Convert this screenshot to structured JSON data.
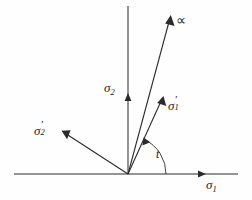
{
  "figure": {
    "type": "vector-diagram",
    "background_color": "#fefefe",
    "ink_color": "#2b2b2b"
  },
  "axes": {
    "origin": {
      "x": 128,
      "y": 174
    },
    "horizontal": {
      "name": "sigma-1-axis",
      "label_sigma": "σ",
      "label_sub": "1",
      "x_start": 14,
      "x_end": 238,
      "y": 174,
      "arrow_at_x": 206
    },
    "vertical": {
      "name": "sigma-2-axis",
      "label_sigma": "σ",
      "label_sub": "2",
      "x": 128,
      "y_top": 6,
      "y_bottom": 174,
      "arrow_at_y": 93
    }
  },
  "vectors": [
    {
      "name": "alpha-vector",
      "label": "∝",
      "from": {
        "x": 128,
        "y": 174
      },
      "to": {
        "x": 170,
        "y": 16
      }
    },
    {
      "name": "sigma-1-prime-vector",
      "label_sigma": "σ",
      "label_prime": "′",
      "label_sub": "1",
      "from": {
        "x": 128,
        "y": 174
      },
      "to": {
        "x": 163,
        "y": 97
      }
    },
    {
      "name": "sigma-2-prime-vector",
      "label_sigma": "σ",
      "label_prime": "′",
      "label_sub": "2",
      "from": {
        "x": 128,
        "y": 174
      },
      "to": {
        "x": 62,
        "y": 131
      }
    }
  ],
  "angle": {
    "name": "rotation-angle-t",
    "label": "t",
    "vertex": {
      "x": 128,
      "y": 174
    },
    "radius": 38,
    "from_deg": 0,
    "to_deg": 65,
    "arrow_end": "start-of-sigma-1-prime"
  }
}
